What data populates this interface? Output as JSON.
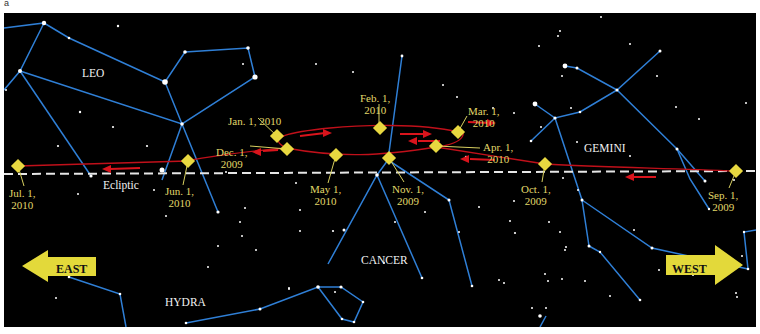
{
  "figure": {
    "panel_letter": "a",
    "background_color": "#000000",
    "constellation_line_color": "#2f7fd6",
    "path_color": "#c0101a",
    "marker_color": "#e8d840",
    "date_label_color": "#e0d86a",
    "ecliptic_color": "#e6e6e6"
  },
  "constellations": {
    "leo": "LEO",
    "gemini": "GEMINI",
    "cancer": "CANCER",
    "hydra": "HYDRA"
  },
  "ecliptic_label": "Ecliptic",
  "directions": {
    "east": "EAST",
    "west": "WEST"
  },
  "dates": [
    {
      "id": "sep-2009",
      "line1": "Sep. 1,",
      "line2": "2009"
    },
    {
      "id": "oct-2009",
      "line1": "Oct. 1,",
      "line2": "2009"
    },
    {
      "id": "nov-2009",
      "line1": "Nov. 1,",
      "line2": "2009"
    },
    {
      "id": "dec-2009",
      "line1": "Dec. 1,",
      "line2": "2009"
    },
    {
      "id": "jan-2010",
      "line1": "Jan. 1, 2010",
      "line2": ""
    },
    {
      "id": "feb-2010",
      "line1": "Feb. 1,",
      "line2": "2010"
    },
    {
      "id": "mar-2010",
      "line1": "Mar. 1,",
      "line2": "2010"
    },
    {
      "id": "apr-2010",
      "line1": "Apr. 1,",
      "line2": "2010"
    },
    {
      "id": "may-2010",
      "line1": "May 1,",
      "line2": "2010"
    },
    {
      "id": "jun-2010",
      "line1": "Jun. 1,",
      "line2": "2010"
    },
    {
      "id": "jul-2010",
      "line1": "Jul. 1,",
      "line2": "2010"
    }
  ]
}
